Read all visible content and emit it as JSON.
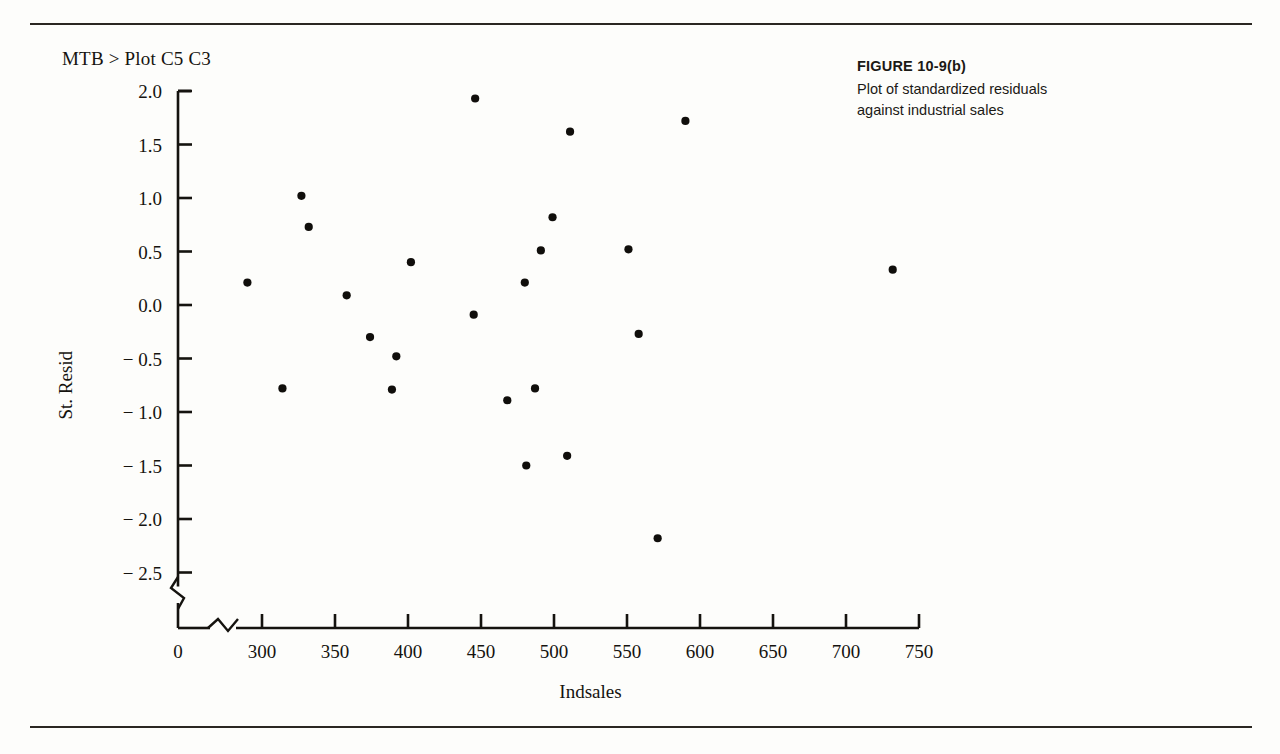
{
  "page": {
    "command_echo": "MTB > Plot C5 C3",
    "rule_color": "#2a2722"
  },
  "caption": {
    "figure_label": "FIGURE 10-9(b)",
    "line1": "Plot of standardized residuals",
    "line2": "against industrial sales"
  },
  "chart_data": {
    "type": "scatter",
    "title": "",
    "xlabel": "Indsales",
    "ylabel": "St. Resid",
    "xlim": [
      275,
      750
    ],
    "ylim": [
      -2.5,
      2.0
    ],
    "grid": false,
    "legend": null,
    "x_origin_label": "0",
    "x_axis_break": true,
    "y_axis_break": true,
    "xticks": [
      300,
      350,
      400,
      450,
      500,
      550,
      600,
      650,
      700,
      750
    ],
    "xtick_labels": [
      "300",
      "350",
      "400",
      "450",
      "500",
      "550",
      "600",
      "650",
      "700",
      "750"
    ],
    "yticks": [
      2.0,
      1.5,
      1.0,
      0.5,
      0.0,
      -0.5,
      -1.0,
      -1.5,
      -2.0,
      -2.5
    ],
    "ytick_labels": [
      "2.0",
      "1.5",
      "1.0",
      "0.5",
      "0.0",
      "− 0.5",
      "− 1.0",
      "− 1.5",
      "− 2.0",
      "− 2.5"
    ],
    "marker": "filled-circle",
    "marker_color": "#100e0b",
    "n_points": 24,
    "x": [
      290,
      314,
      327,
      332,
      358,
      374,
      389,
      392,
      402,
      445,
      446,
      468,
      480,
      481,
      487,
      491,
      499,
      509,
      511,
      551,
      558,
      571,
      590,
      732
    ],
    "y": [
      0.21,
      -0.78,
      1.02,
      0.73,
      0.09,
      -0.3,
      -0.79,
      -0.48,
      0.4,
      -0.09,
      1.93,
      -0.89,
      0.21,
      -1.5,
      -0.78,
      0.51,
      0.82,
      -1.41,
      1.62,
      0.52,
      -0.27,
      -2.18,
      1.72,
      0.33
    ],
    "points": [
      {
        "x": 290,
        "y": 0.21
      },
      {
        "x": 314,
        "y": -0.78
      },
      {
        "x": 327,
        "y": 1.02
      },
      {
        "x": 332,
        "y": 0.73
      },
      {
        "x": 358,
        "y": 0.09
      },
      {
        "x": 374,
        "y": -0.3
      },
      {
        "x": 389,
        "y": -0.79
      },
      {
        "x": 392,
        "y": -0.48
      },
      {
        "x": 402,
        "y": 0.4
      },
      {
        "x": 445,
        "y": -0.09
      },
      {
        "x": 446,
        "y": 1.93
      },
      {
        "x": 468,
        "y": -0.89
      },
      {
        "x": 480,
        "y": 0.21
      },
      {
        "x": 481,
        "y": -1.5
      },
      {
        "x": 487,
        "y": -0.78
      },
      {
        "x": 491,
        "y": 0.51
      },
      {
        "x": 499,
        "y": 0.82
      },
      {
        "x": 509,
        "y": -1.41
      },
      {
        "x": 511,
        "y": 1.62
      },
      {
        "x": 551,
        "y": 0.52
      },
      {
        "x": 558,
        "y": -0.27
      },
      {
        "x": 571,
        "y": -2.18
      },
      {
        "x": 590,
        "y": 1.72
      },
      {
        "x": 732,
        "y": 0.33
      }
    ]
  }
}
